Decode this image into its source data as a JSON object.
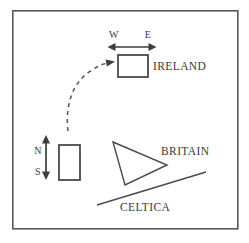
{
  "figure": {
    "type": "line-diagram",
    "background_color": "#ffffff",
    "ink_color": "#4a4a4a",
    "frame": {
      "name": "outer-border",
      "x": 12,
      "y": 10,
      "width": 226,
      "height": 219
    },
    "labels": {
      "ireland": "IRELAND",
      "britain": "BRITAIN",
      "celtica": "CELTICA",
      "west": "W",
      "east": "E",
      "north": "N",
      "south": "S"
    },
    "shapes": {
      "ireland_box": {
        "x": 118,
        "y": 55,
        "width": 30,
        "height": 22
      },
      "origin_box": {
        "x": 59,
        "y": 145,
        "width": 21,
        "height": 35
      },
      "britain_triangle": {
        "points": "113,142 167,165 125,185"
      },
      "celtica_line": {
        "x1": 97,
        "y1": 205,
        "x2": 206,
        "y2": 172
      }
    },
    "arrows": {
      "we_axis": {
        "x1": 109,
        "y1": 47,
        "x2": 155,
        "y2": 47,
        "orientation": "horizontal",
        "double_headed": true
      },
      "ns_axis": {
        "x1": 46,
        "y1": 136,
        "x2": 46,
        "y2": 179,
        "orientation": "vertical",
        "double_headed": true
      },
      "migration_path": {
        "start_x": 68,
        "start_y": 131,
        "end_x": 112,
        "end_y": 62,
        "style": "dashed",
        "double_headed": false
      }
    }
  }
}
